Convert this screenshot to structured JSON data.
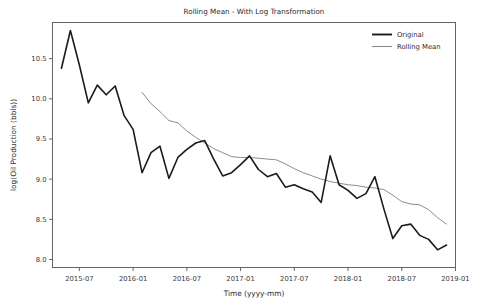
{
  "chart_data": {
    "type": "line",
    "title": "Rolling Mean - With Log Transformation",
    "xlabel": "Time (yyyy-mm)",
    "ylabel": "log(Oil Production (bbls))",
    "grid": false,
    "legend_position": "upper-right",
    "ylim": [
      7.9,
      10.95
    ],
    "xlim": [
      "2015-04",
      "2019-01"
    ],
    "ytick_labels": [
      "8.0",
      "8.5",
      "9.0",
      "9.5",
      "10.0",
      "10.5"
    ],
    "ytick_values": [
      8.0,
      8.5,
      9.0,
      9.5,
      10.0,
      10.5
    ],
    "xtick_labels": [
      "2015-07",
      "2016-01",
      "2016-07",
      "2017-01",
      "2017-07",
      "2018-01",
      "2018-07",
      "2019-01"
    ],
    "xtick_months": [
      "2015-07",
      "2016-01",
      "2016-07",
      "2017-01",
      "2017-07",
      "2018-01",
      "2018-07",
      "2019-01"
    ],
    "colors": {
      "original": "#1b1b1b",
      "rolling_mean": "#8c8c8c",
      "axis": "#555555",
      "text": "#2b2b2b",
      "background": "#ffffff"
    },
    "series": [
      {
        "name": "Original",
        "color": "#1b1b1b",
        "linewidth": 1.6,
        "x": [
          "2015-05",
          "2015-06",
          "2015-07",
          "2015-08",
          "2015-09",
          "2015-10",
          "2015-11",
          "2015-12",
          "2016-01",
          "2016-02",
          "2016-03",
          "2016-04",
          "2016-05",
          "2016-06",
          "2016-07",
          "2016-08",
          "2016-09",
          "2016-10",
          "2016-11",
          "2016-12",
          "2017-01",
          "2017-02",
          "2017-03",
          "2017-04",
          "2017-05",
          "2017-06",
          "2017-07",
          "2017-08",
          "2017-09",
          "2017-10",
          "2017-11",
          "2017-12",
          "2018-01",
          "2018-02",
          "2018-03",
          "2018-04",
          "2018-05",
          "2018-06",
          "2018-07",
          "2018-08",
          "2018-09",
          "2018-10",
          "2018-11",
          "2018-12"
        ],
        "values": [
          10.38,
          10.85,
          10.42,
          9.95,
          10.17,
          10.05,
          10.16,
          9.79,
          9.62,
          9.08,
          9.33,
          9.41,
          9.01,
          9.27,
          9.37,
          9.45,
          9.48,
          9.25,
          9.04,
          9.08,
          9.18,
          9.29,
          9.12,
          9.03,
          9.07,
          8.9,
          8.93,
          8.88,
          8.84,
          8.71,
          9.29,
          8.93,
          8.86,
          8.76,
          8.82,
          9.03,
          8.63,
          8.26,
          8.42,
          8.44,
          8.3,
          8.25,
          8.12,
          8.18
        ]
      },
      {
        "name": "Rolling Mean",
        "color": "#8c8c8c",
        "linewidth": 1.0,
        "x": [
          "2016-02",
          "2016-03",
          "2016-04",
          "2016-05",
          "2016-06",
          "2016-07",
          "2016-08",
          "2016-09",
          "2016-10",
          "2016-11",
          "2016-12",
          "2017-01",
          "2017-02",
          "2017-03",
          "2017-04",
          "2017-05",
          "2017-06",
          "2017-07",
          "2017-08",
          "2017-09",
          "2017-10",
          "2017-11",
          "2017-12",
          "2018-01",
          "2018-02",
          "2018-03",
          "2018-04",
          "2018-05",
          "2018-06",
          "2018-07",
          "2018-08",
          "2018-09",
          "2018-10",
          "2018-11",
          "2018-12"
        ],
        "values": [
          10.08,
          9.94,
          9.84,
          9.73,
          9.7,
          9.6,
          9.52,
          9.45,
          9.38,
          9.33,
          9.28,
          9.27,
          9.27,
          9.26,
          9.25,
          9.24,
          9.19,
          9.13,
          9.08,
          9.04,
          9.0,
          8.97,
          8.95,
          8.93,
          8.92,
          8.9,
          8.89,
          8.87,
          8.8,
          8.72,
          8.69,
          8.68,
          8.62,
          8.52,
          8.44
        ]
      }
    ]
  },
  "legend": {
    "entries": [
      {
        "label": "Original"
      },
      {
        "label": "Rolling Mean"
      }
    ]
  }
}
